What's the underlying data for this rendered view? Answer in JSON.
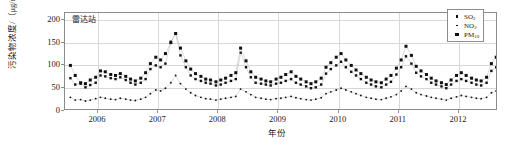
{
  "chart_data": {
    "type": "line",
    "title": "",
    "panel_label": "雷达站",
    "xlabel": "年份",
    "ylabel": "污染物浓度/（μg/m³）",
    "ylim": [
      0,
      215
    ],
    "yticks": [
      0,
      50,
      100,
      150,
      200
    ],
    "xlim": [
      2005.45,
      2012.65
    ],
    "xticks": [
      2006,
      2007,
      2008,
      2009,
      2010,
      2011,
      2012
    ],
    "xtick_labels": [
      "2006",
      "2007",
      "2008",
      "2009",
      "2010",
      "2011",
      "2012"
    ],
    "grid": "horizontal-and-vertical",
    "legend_position": "top-right",
    "x": [
      2005.54,
      2005.62,
      2005.71,
      2005.79,
      2005.87,
      2005.96,
      2006.04,
      2006.12,
      2006.21,
      2006.29,
      2006.37,
      2006.46,
      2006.54,
      2006.62,
      2006.71,
      2006.79,
      2006.87,
      2006.96,
      2007.04,
      2007.12,
      2007.21,
      2007.29,
      2007.37,
      2007.46,
      2007.54,
      2007.62,
      2007.71,
      2007.79,
      2007.87,
      2007.96,
      2008.04,
      2008.12,
      2008.21,
      2008.29,
      2008.37,
      2008.46,
      2008.54,
      2008.62,
      2008.71,
      2008.79,
      2008.87,
      2008.96,
      2009.04,
      2009.12,
      2009.21,
      2009.29,
      2009.37,
      2009.46,
      2009.54,
      2009.62,
      2009.71,
      2009.79,
      2009.87,
      2009.96,
      2010.04,
      2010.12,
      2010.21,
      2010.29,
      2010.37,
      2010.46,
      2010.54,
      2010.62,
      2010.71,
      2010.79,
      2010.87,
      2010.96,
      2011.04,
      2011.12,
      2011.21,
      2011.29,
      2011.37,
      2011.46,
      2011.54,
      2011.62,
      2011.71,
      2011.79,
      2011.87,
      2011.96,
      2012.04,
      2012.12,
      2012.21,
      2012.29,
      2012.37,
      2012.46,
      2012.54,
      2012.62
    ],
    "series": [
      {
        "name": "SO2",
        "label": "SO₂",
        "marker": "square-medium",
        "values": [
          72,
          58,
          60,
          52,
          57,
          62,
          78,
          76,
          72,
          70,
          74,
          68,
          62,
          58,
          62,
          70,
          92,
          100,
          96,
          104,
          152,
          170,
          122,
          96,
          78,
          70,
          66,
          62,
          60,
          56,
          58,
          62,
          66,
          70,
          128,
          96,
          74,
          62,
          60,
          58,
          56,
          60,
          62,
          66,
          70,
          62,
          58,
          54,
          50,
          52,
          58,
          82,
          92,
          100,
          108,
          96,
          86,
          78,
          70,
          62,
          58,
          54,
          52,
          58,
          64,
          80,
          96,
          120,
          104,
          84,
          76,
          70,
          62,
          58,
          54,
          50,
          58,
          66,
          70,
          66,
          62,
          58,
          56,
          62,
          88,
          96
        ]
      },
      {
        "name": "NO2",
        "label": "NO₂",
        "marker": "dot-small",
        "values": [
          30,
          24,
          25,
          22,
          24,
          27,
          30,
          28,
          26,
          25,
          28,
          26,
          24,
          23,
          26,
          30,
          38,
          46,
          44,
          50,
          62,
          78,
          60,
          48,
          40,
          34,
          30,
          27,
          26,
          24,
          26,
          28,
          30,
          32,
          48,
          42,
          36,
          30,
          28,
          26,
          25,
          27,
          28,
          30,
          32,
          29,
          27,
          25,
          24,
          26,
          29,
          38,
          42,
          46,
          50,
          46,
          42,
          38,
          34,
          30,
          28,
          26,
          25,
          28,
          31,
          36,
          44,
          54,
          48,
          40,
          36,
          33,
          30,
          28,
          26,
          24,
          28,
          31,
          34,
          32,
          30,
          28,
          27,
          30,
          40,
          44
        ]
      },
      {
        "name": "PM10",
        "label": "PM₁₀",
        "marker": "square-large",
        "values": [
          100,
          78,
          62,
          60,
          68,
          74,
          88,
          86,
          80,
          78,
          82,
          76,
          70,
          66,
          72,
          84,
          104,
          118,
          112,
          126,
          150,
          170,
          138,
          110,
          92,
          82,
          76,
          70,
          68,
          64,
          68,
          72,
          78,
          84,
          138,
          110,
          86,
          74,
          70,
          66,
          64,
          70,
          74,
          80,
          86,
          76,
          70,
          64,
          60,
          64,
          72,
          96,
          106,
          118,
          126,
          112,
          100,
          90,
          82,
          74,
          68,
          64,
          62,
          70,
          78,
          94,
          112,
          142,
          122,
          98,
          88,
          80,
          72,
          66,
          62,
          58,
          68,
          78,
          84,
          78,
          72,
          68,
          66,
          74,
          104,
          118
        ]
      }
    ]
  },
  "legend": {
    "items": [
      {
        "label_main": "SO",
        "label_sub": "2"
      },
      {
        "label_main": "NO",
        "label_sub": "2"
      },
      {
        "label_main": "PM",
        "label_sub": "10"
      }
    ]
  }
}
